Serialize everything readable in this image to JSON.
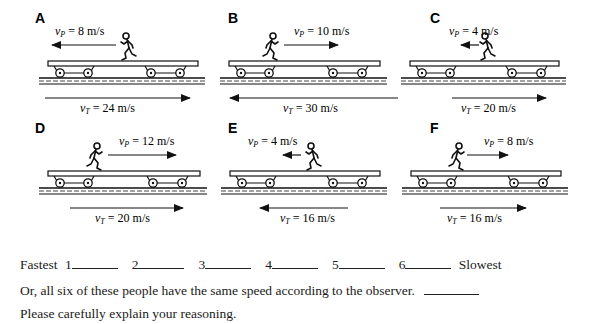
{
  "panels": [
    {
      "label": "A",
      "person": {
        "symbol": "v",
        "sub": "P",
        "value": "8 m/s",
        "direction": "left"
      },
      "train": {
        "symbol": "v",
        "sub": "T",
        "value": "24 m/s",
        "direction": "right"
      }
    },
    {
      "label": "B",
      "person": {
        "symbol": "v",
        "sub": "P",
        "value": "10 m/s",
        "direction": "right"
      },
      "train": {
        "symbol": "v",
        "sub": "T",
        "value": "30 m/s",
        "direction": "left"
      }
    },
    {
      "label": "C",
      "person": {
        "symbol": "v",
        "sub": "P",
        "value": "4 m/s",
        "direction": "left"
      },
      "train": {
        "symbol": "v",
        "sub": "T",
        "value": "20 m/s",
        "direction": "right"
      }
    },
    {
      "label": "D",
      "person": {
        "symbol": "v",
        "sub": "P",
        "value": "12 m/s",
        "direction": "right"
      },
      "train": {
        "symbol": "v",
        "sub": "T",
        "value": "20 m/s",
        "direction": "right"
      }
    },
    {
      "label": "E",
      "person": {
        "symbol": "v",
        "sub": "P",
        "value": "4 m/s",
        "direction": "left"
      },
      "train": {
        "symbol": "v",
        "sub": "T",
        "value": "16 m/s",
        "direction": "left"
      }
    },
    {
      "label": "F",
      "person": {
        "symbol": "v",
        "sub": "P",
        "value": "8 m/s",
        "direction": "right"
      },
      "train": {
        "symbol": "v",
        "sub": "T",
        "value": "16 m/s",
        "direction": "right"
      }
    }
  ],
  "ranking": {
    "start_label": "Fastest",
    "end_label": "Slowest",
    "slots": [
      "1",
      "2",
      "3",
      "4",
      "5",
      "6"
    ]
  },
  "same_speed_text": "Or, all six of these people have the same speed according to the observer.",
  "explain_text": "Please carefully explain your reasoning."
}
